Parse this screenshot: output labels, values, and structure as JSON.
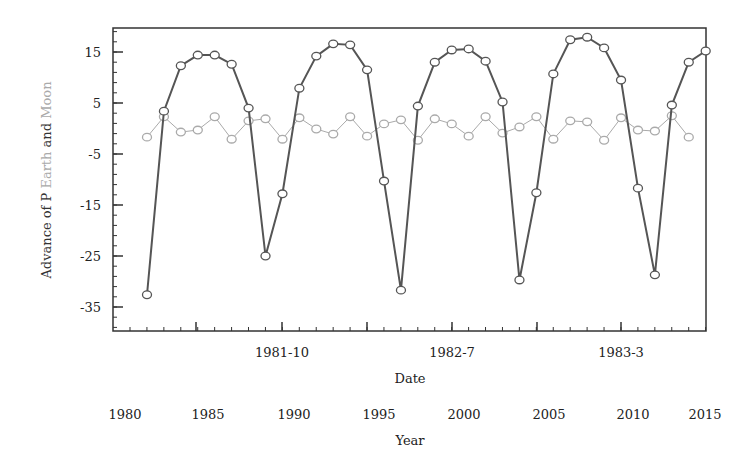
{
  "chart_data": {
    "type": "line",
    "title": "",
    "xlabel": "Date",
    "xlabel_secondary": "Year",
    "ylabel_parts": [
      {
        "text": "Advance of P ",
        "color": "#333333"
      },
      {
        "text": "Earth",
        "color": "#aaaaaa"
      },
      {
        "text": " and ",
        "color": "#333333"
      },
      {
        "text": "Moon",
        "color": "#aaaaaa"
      }
    ],
    "ylim": [
      -40,
      20
    ],
    "yticks": [
      15,
      5,
      -5,
      -15,
      -25,
      -35
    ],
    "x_major_tick_labels": [
      "1981-10",
      "1982-7",
      "1983-3"
    ],
    "x_secondary_tick_labels": [
      "1980",
      "1985",
      "1990",
      "1995",
      "2000",
      "2005",
      "2010",
      "2015"
    ],
    "grid": false,
    "legend": null,
    "series": [
      {
        "name": "Earth",
        "color": "#555555",
        "marker": "circle",
        "x_index": [
          0,
          1,
          2,
          3,
          4,
          5,
          6,
          7,
          8,
          9,
          10,
          11,
          12,
          13,
          14,
          15,
          16,
          17,
          18,
          19,
          20,
          21,
          22,
          23,
          24,
          25,
          26,
          27,
          28,
          29,
          30,
          31,
          32,
          33
        ],
        "values": [
          -32.6,
          3.4,
          12.3,
          14.4,
          14.4,
          12.6,
          4.0,
          -25.0,
          -12.8,
          7.9,
          14.2,
          16.6,
          16.4,
          11.5,
          -10.3,
          -31.7,
          4.4,
          13.0,
          15.4,
          15.6,
          13.2,
          5.2,
          -29.7,
          -12.6,
          10.7,
          17.4,
          17.9,
          15.8,
          9.5,
          -11.7,
          -28.7,
          4.6,
          13.0,
          15.2
        ]
      },
      {
        "name": "Moon",
        "color": "#aaaaaa",
        "marker": "circle",
        "x_index": [
          0,
          1,
          2,
          3,
          4,
          5,
          6,
          7,
          8,
          9,
          10,
          11,
          12,
          13,
          14,
          15,
          16,
          17,
          18,
          19,
          20,
          21,
          22,
          23,
          24,
          25,
          26,
          27,
          28,
          29,
          30,
          31,
          32
        ],
        "values": [
          -1.7,
          2.3,
          -0.7,
          -0.3,
          2.3,
          -2.1,
          1.5,
          1.9,
          -2.1,
          2.1,
          -0.1,
          -1.1,
          2.3,
          -1.5,
          0.9,
          1.7,
          -2.3,
          1.9,
          0.9,
          -1.5,
          2.3,
          -0.9,
          0.3,
          2.3,
          -2.1,
          1.5,
          1.3,
          -2.3,
          2.1,
          -0.3,
          -0.5,
          2.5,
          -1.7
        ]
      }
    ]
  },
  "layout_px": {
    "plot_left": 113,
    "plot_right": 706,
    "plot_top": 28,
    "plot_bottom": 331,
    "x_first_point": 147,
    "x_step": 16.93,
    "y_ref_value": 15,
    "y_ref_px": 52,
    "px_per_unit": 5.1,
    "x_major_tick_px": [
      282,
      452,
      621
    ],
    "x_secondary_label_px": [
      113,
      196,
      282,
      367,
      452,
      537,
      621,
      693
    ]
  }
}
